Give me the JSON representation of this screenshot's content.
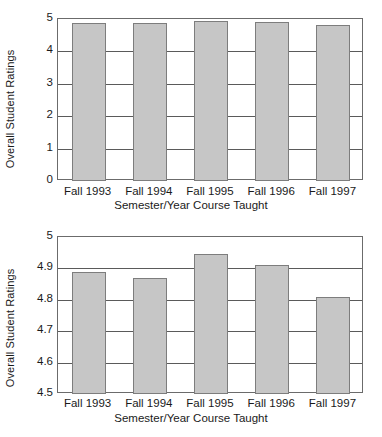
{
  "chart_data": [
    {
      "id": "top",
      "type": "bar",
      "title": "",
      "xlabel": "Semester/Year Course Taught",
      "ylabel": "Overall Student Ratings",
      "categories": [
        "Fall 1993",
        "Fall 1994",
        "Fall 1995",
        "Fall 1996",
        "Fall 1997"
      ],
      "values": [
        4.89,
        4.87,
        4.95,
        4.91,
        4.81
      ],
      "ylim": [
        0,
        5
      ],
      "yticks": [
        0,
        1,
        2,
        3,
        4,
        5
      ],
      "ytick_labels": [
        "0",
        "1",
        "2",
        "3",
        "4",
        "5"
      ],
      "grid": true,
      "legend": "none",
      "bar_color": "#c6c6c6",
      "bar_edge_color": "#7d7d7d"
    },
    {
      "id": "bottom",
      "type": "bar",
      "title": "",
      "xlabel": "Semester/Year Course Taught",
      "ylabel": "Overall Student Ratings",
      "categories": [
        "Fall 1993",
        "Fall 1994",
        "Fall 1995",
        "Fall 1996",
        "Fall 1997"
      ],
      "values": [
        4.89,
        4.87,
        4.945,
        4.91,
        4.81
      ],
      "ylim": [
        4.5,
        5.0
      ],
      "yticks": [
        4.5,
        4.6,
        4.7,
        4.8,
        4.9,
        5.0
      ],
      "ytick_labels": [
        "4.5",
        "4.6",
        "4.7",
        "4.8",
        "4.9",
        "5"
      ],
      "grid": true,
      "legend": "none",
      "bar_color": "#c6c6c6",
      "bar_edge_color": "#7d7d7d"
    }
  ]
}
